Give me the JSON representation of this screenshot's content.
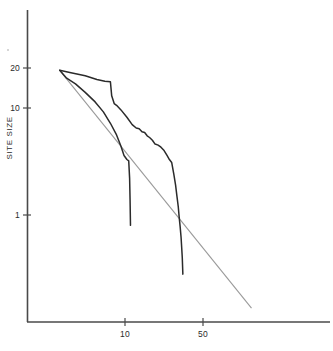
{
  "figure": {
    "background_color": "#ffffff",
    "ink_color": "#2b2b2b",
    "reference_line_color": "#9a9a9a"
  },
  "chart_data": {
    "type": "line",
    "title": "",
    "subtitle": "",
    "xlabel": "",
    "ylabel": "SITE SIZE",
    "xscale": "log",
    "yscale": "log",
    "grid": false,
    "legend": "none",
    "xlim": [
      2.2,
      140
    ],
    "ylim": [
      0.13,
      60
    ],
    "xticks": [
      10,
      50
    ],
    "xtick_labels": [
      "10",
      "50"
    ],
    "yticks": [
      1,
      10,
      20
    ],
    "ytick_labels": [
      "1",
      "10",
      "20"
    ],
    "annotations": [],
    "series": [
      {
        "name": "upper-rank-size-curve",
        "style": "stepped-solid",
        "color": "#2b2b2b",
        "x": [
          2.6,
          3.2,
          4.4,
          5.6,
          6.6,
          7.4,
          7.6,
          8.0,
          8.4,
          9.2,
          10.4,
          11.6,
          12.6,
          13.4,
          14.2,
          15.0,
          15.8,
          16.6,
          17.6,
          18.6,
          19.8,
          21.0,
          22.4,
          23.8,
          25.0,
          26.2,
          27.4,
          28.4,
          29.2,
          30.0,
          30.6,
          31.2,
          31.8,
          32.2,
          32.6,
          33.0
        ],
        "y": [
          22.5,
          21.5,
          20.0,
          18.5,
          17.8,
          17.6,
          13.0,
          11.0,
          10.6,
          9.6,
          8.2,
          7.0,
          6.5,
          6.4,
          6.0,
          5.9,
          5.5,
          5.3,
          5.0,
          4.6,
          4.5,
          4.3,
          4.0,
          3.6,
          3.3,
          3.1,
          2.4,
          1.9,
          1.5,
          1.2,
          0.95,
          0.78,
          0.62,
          0.5,
          0.4,
          0.28
        ]
      },
      {
        "name": "lower-rank-size-curve",
        "style": "stepped-solid",
        "color": "#2b2b2b",
        "x": [
          2.6,
          3.0,
          3.6,
          4.4,
          5.4,
          6.4,
          7.4,
          8.4,
          9.2,
          9.8,
          10.4,
          10.8,
          11.0,
          11.1,
          11.2
        ],
        "y": [
          22.5,
          19.0,
          16.8,
          14.0,
          11.4,
          9.2,
          7.2,
          5.6,
          4.4,
          3.6,
          3.3,
          3.2,
          2.2,
          1.4,
          0.8
        ]
      },
      {
        "name": "reference-straight-line",
        "style": "straight-solid",
        "color": "#9a9a9a",
        "x": [
          2.6,
          136.0
        ],
        "y": [
          22.5,
          0.135
        ]
      }
    ]
  }
}
